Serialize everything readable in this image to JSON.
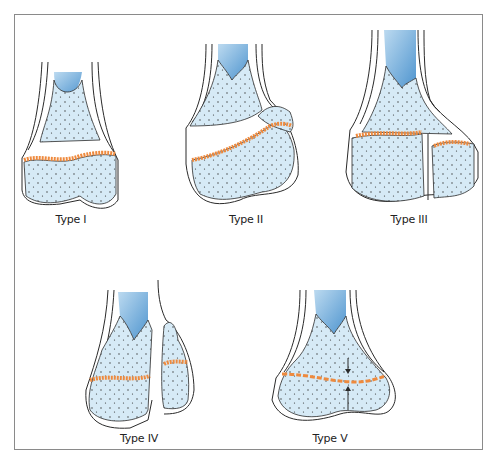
{
  "figure": {
    "panels": [
      {
        "id": "type-1",
        "label": "Type I"
      },
      {
        "id": "type-2",
        "label": "Type II"
      },
      {
        "id": "type-3",
        "label": "Type III"
      },
      {
        "id": "type-4",
        "label": "Type IV"
      },
      {
        "id": "type-5",
        "label": "Type V"
      }
    ],
    "colors": {
      "bone_fill": "#d6eaf6",
      "marrow": "#6aa9d8",
      "physis": "#ee8a3e",
      "outline": "#2a2a2a",
      "frame": "#8a8a8a"
    }
  }
}
